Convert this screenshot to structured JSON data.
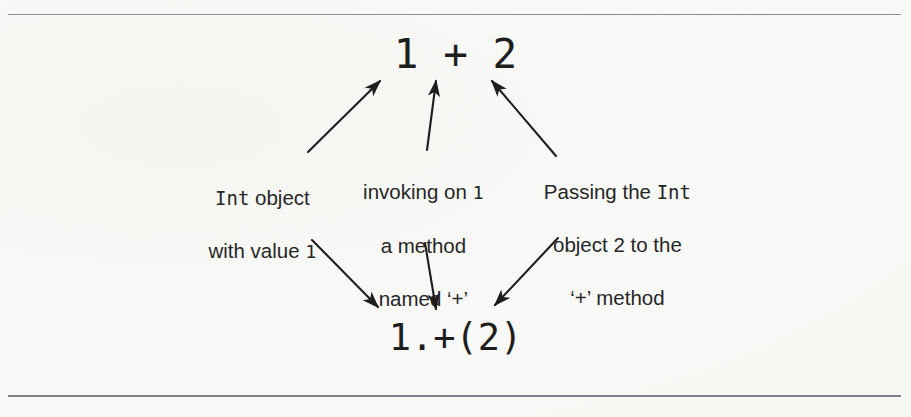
{
  "diagram": {
    "top_expression": "1 + 2",
    "bottom_expression": "1.+(2)",
    "ink_color": "#1e1e1e",
    "paper_color": "#fbfbf9",
    "rule_color": "#8d8f92",
    "labels": [
      {
        "id": "left",
        "code_term": "Int",
        "line1_rest": " object",
        "line2": "with value ",
        "line2_num": "1",
        "full_text": "Int object with value 1"
      },
      {
        "id": "middle",
        "line1": "invoking on ",
        "line1_num": "1",
        "line2": "a method",
        "line3": "named ‘+’",
        "full_text": "invoking on 1 a method named ‘+’"
      },
      {
        "id": "right",
        "line1_start": "Passing the ",
        "code_term": "Int",
        "line2": "object 2 to the",
        "line3": "‘+’ method",
        "full_text": "Passing the Int object 2 to the ‘+’ method"
      }
    ],
    "arrows": [
      {
        "name": "left-label-to-top-expression",
        "from": [
          308,
          152
        ],
        "to": [
          379,
          80
        ],
        "direction": "up-right"
      },
      {
        "name": "middle-label-to-top-expression",
        "from": [
          427,
          150
        ],
        "to": [
          436,
          80
        ],
        "direction": "up"
      },
      {
        "name": "right-label-to-top-expression",
        "from": [
          556,
          156
        ],
        "to": [
          492,
          80
        ],
        "direction": "up-left"
      },
      {
        "name": "left-label-to-bottom-expression",
        "from": [
          312,
          240
        ],
        "to": [
          379,
          308
        ],
        "direction": "down-right"
      },
      {
        "name": "middle-label-to-bottom-expression",
        "from": [
          425,
          243
        ],
        "to": [
          436,
          310
        ],
        "direction": "down"
      },
      {
        "name": "right-label-to-bottom-expression",
        "from": [
          558,
          238
        ],
        "to": [
          494,
          306
        ],
        "direction": "down-left"
      }
    ]
  }
}
